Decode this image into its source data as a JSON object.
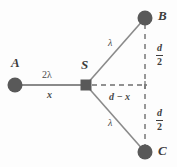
{
  "figure": {
    "background_color": "#fdfdfd",
    "stroke_color": "#7a7a7a",
    "node_fill": "#595959",
    "text_color": "#3d3d3d"
  },
  "nodes": [
    {
      "id": "A",
      "label": "A",
      "shape": "circle",
      "x": 15,
      "y": 85,
      "r": 7.5
    },
    {
      "id": "S",
      "label": "S",
      "shape": "square",
      "x": 86,
      "y": 85,
      "size": 11
    },
    {
      "id": "B",
      "label": "B",
      "shape": "circle",
      "x": 145,
      "y": 18,
      "r": 7.5
    },
    {
      "id": "C",
      "label": "C",
      "shape": "circle",
      "x": 145,
      "y": 152,
      "r": 7.5
    }
  ],
  "edges": [
    {
      "id": "A-S",
      "from": "A",
      "to": "S",
      "style": "solid"
    },
    {
      "id": "S-B",
      "from": "S",
      "to": "B",
      "style": "solid"
    },
    {
      "id": "S-C",
      "from": "S",
      "to": "C",
      "style": "solid"
    },
    {
      "id": "S-M",
      "from": "S",
      "to": "midpoint",
      "style": "dashed"
    },
    {
      "id": "B-C",
      "from": "B",
      "to": "C",
      "style": "dashed"
    }
  ],
  "labels": {
    "two_lambda": "2λ",
    "x": "x",
    "lambda_upper": "λ",
    "lambda_lower": "λ",
    "d_minus_x": "d − x",
    "d_over_2_numerator": "d",
    "d_over_2_denominator": "2"
  }
}
